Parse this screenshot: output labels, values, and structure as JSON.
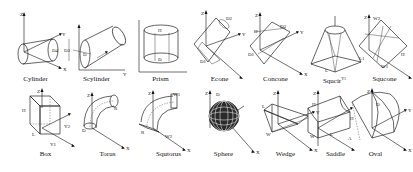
{
  "figure": {
    "rows": [
      {
        "shapes": [
          {
            "name": "Cylinder",
            "axes": [
              "Z",
              "Y",
              "X"
            ],
            "params": [
              "D3",
              "D4"
            ]
          },
          {
            "name": "Scylinder",
            "axes": [
              "Z",
              "Y",
              "X"
            ],
            "params": [
              "D"
            ]
          },
          {
            "name": "Prism",
            "axes": [
              "Z",
              "Y",
              "X"
            ],
            "params": [
              "H",
              "D"
            ]
          },
          {
            "name": "Econe",
            "axes": [
              "Z",
              "Y",
              "X"
            ],
            "params": [
              "D2",
              "D1"
            ]
          },
          {
            "name": "Concone",
            "axes": [
              "Z",
              "Y",
              "X"
            ],
            "params": [
              "H",
              "D1",
              "D2"
            ]
          },
          {
            "name": "Squcir",
            "axes": [
              "Z",
              "Y",
              "X"
            ],
            "params": [
              "L",
              "Y1"
            ]
          },
          {
            "name": "Squcone",
            "axes": [
              "Z",
              "Y",
              "X"
            ],
            "params": [
              "W2",
              "W1",
              "L1",
              "H"
            ]
          }
        ]
      },
      {
        "shapes": [
          {
            "name": "Box",
            "axes": [
              "Z",
              "Y",
              "X"
            ],
            "params": [
              "H",
              "L",
              "Y1",
              "Y2"
            ]
          },
          {
            "name": "Torus",
            "axes": [
              "Z",
              "Y",
              "X"
            ],
            "params": [
              "D",
              "R"
            ]
          },
          {
            "name": "Squtorus",
            "axes": [
              "Z",
              "Y",
              "X"
            ],
            "params": [
              "W1",
              "W2",
              "R"
            ]
          },
          {
            "name": "Sphere",
            "axes": [
              "Z",
              "Y",
              "X"
            ],
            "params": [
              "D"
            ]
          },
          {
            "name": "Wedge",
            "axes": [
              "Z",
              "Y",
              "X"
            ],
            "params": [
              "L",
              "W"
            ]
          },
          {
            "name": "Saddle",
            "axes": [
              "Z",
              "Y",
              "X"
            ],
            "params": [
              "H",
              "W",
              "A",
              "L"
            ]
          },
          {
            "name": "Oval",
            "axes": [
              "Z",
              "Y",
              "X"
            ],
            "params": [
              "H",
              "D"
            ]
          }
        ]
      }
    ]
  }
}
